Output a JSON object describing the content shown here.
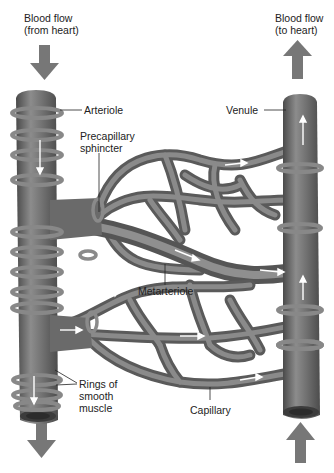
{
  "figure": {
    "colors": {
      "vessel": "#6e6e6e",
      "vessel_highlight": "#9a9a9a",
      "vessel_shadow": "#4a4a4a",
      "ring": "#8a8a8a",
      "flow_arrow": "#7a7a7a",
      "inner_arrow": "#ffffff",
      "label_text": "#222222",
      "background": "#ffffff"
    }
  },
  "labels": {
    "flow_in": "Blood flow\n(from heart)",
    "flow_out": "Blood flow\n(to heart)",
    "arteriole": "Arteriole",
    "venule": "Venule",
    "precapillary_sphincter": "Precapillary\nsphincter",
    "metarteriole": "Metarteriole",
    "rings_smooth_muscle": "Rings of\nsmooth\nmuscle",
    "capillary": "Capillary"
  },
  "flow_arrows": [
    {
      "id": "in-top-left",
      "direction": "down"
    },
    {
      "id": "out-top-right",
      "direction": "up"
    },
    {
      "id": "out-bottom-left",
      "direction": "down"
    },
    {
      "id": "in-bottom-right",
      "direction": "up"
    }
  ]
}
